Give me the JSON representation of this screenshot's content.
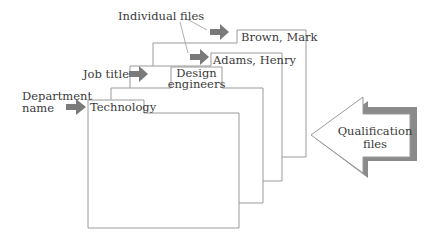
{
  "diagram": {
    "type": "nested-file-folders",
    "labels": {
      "individual_files": "Individual files",
      "job_title": "Job title",
      "department_line1": "Department",
      "department_line2": "name"
    },
    "folders": [
      {
        "tab": "Brown, Mark",
        "level": "individual file"
      },
      {
        "tab": "Adams, Henry",
        "level": "individual file"
      },
      {
        "tab_line1": "Design",
        "tab_line2": "engineers",
        "level": "job title"
      },
      {
        "tab": "Technology",
        "level": "department name"
      }
    ],
    "big_arrow": {
      "line1": "Qualification",
      "line2": "files"
    },
    "colors": {
      "folder_stroke": "#9a9a9a",
      "arrow_fill": "#7a7a7a",
      "text": "#3a3a3a"
    }
  }
}
